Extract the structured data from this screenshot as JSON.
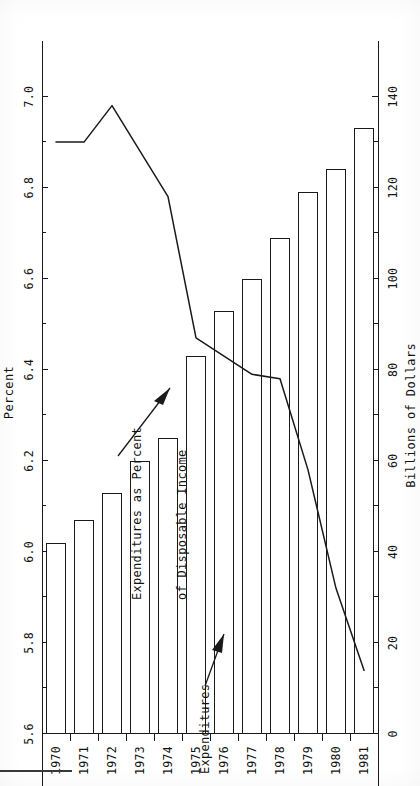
{
  "figure": {
    "orientation": "rotated-90-ccw",
    "ink_color": "#1a1a1a",
    "paper_color": "#ffffff"
  },
  "chart_data": {
    "type": "bar",
    "title": "",
    "categories": [
      "1970",
      "1971",
      "1972",
      "1973",
      "1974",
      "1975",
      "1976",
      "1977",
      "1978",
      "1979",
      "1980",
      "1981"
    ],
    "series": [
      {
        "name": "Expenditures",
        "kind": "bar",
        "axis": "bottom",
        "unit": "Billions of Dollars",
        "values": [
          42,
          47,
          53,
          60,
          65,
          83,
          93,
          100,
          109,
          119,
          124,
          133
        ]
      },
      {
        "name": "Expenditures as Percent of Disposable Income",
        "kind": "line",
        "axis": "top",
        "unit": "Percent",
        "values": [
          6.9,
          6.9,
          6.98,
          6.88,
          6.78,
          6.47,
          6.43,
          6.39,
          6.38,
          6.18,
          5.92,
          5.74
        ]
      }
    ],
    "bottom_axis": {
      "label": "Billions of Dollars",
      "ticks": [
        "0",
        "20",
        "40",
        "60",
        "80",
        "100",
        "120",
        "140"
      ],
      "values": [
        0,
        20,
        40,
        60,
        80,
        100,
        120,
        140
      ],
      "min": 0,
      "max": 150,
      "minor_ticks_between": 1
    },
    "top_axis": {
      "label": "Percent",
      "ticks": [
        "5.6",
        "5.8",
        "6.0",
        "6.2",
        "6.4",
        "6.6",
        "6.8",
        "7.0"
      ],
      "values": [
        5.6,
        5.8,
        6.0,
        6.2,
        6.4,
        6.6,
        6.8,
        7.0
      ],
      "min": 5.6,
      "max": 7.1,
      "minor_ticks_between": 1
    },
    "category_axis": {
      "label": "",
      "ticks": [
        "1970",
        "1971",
        "1972",
        "1973",
        "1974",
        "1975",
        "1976",
        "1977",
        "1978",
        "1979",
        "1980",
        "1981"
      ]
    },
    "annotations": [
      {
        "id": "bars-annotation",
        "text": "Expenditures",
        "points_to": "1971-bar"
      },
      {
        "id": "line-annotation",
        "line1": "Expenditures as Percent",
        "line2": "of Disposable Income",
        "text": "Expenditures as Percent of Disposable Income",
        "points_to": "percent-line-1974"
      }
    ],
    "grid": false,
    "legend": "inline-annotations"
  }
}
